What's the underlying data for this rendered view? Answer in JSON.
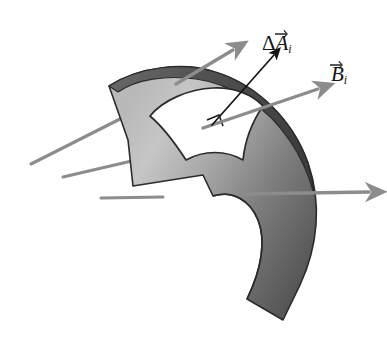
{
  "figure": {
    "name": "magnetic-flux-through-curved-surface",
    "background_color": "#ffffff",
    "width": 387,
    "height": 348
  },
  "labels": {
    "delta_area": {
      "delta": "Δ",
      "symbol": "A",
      "subscript": "i",
      "full_text": "ΔA⃗ᵢ",
      "color": "#141414"
    },
    "b_field": {
      "symbol": "B",
      "subscript": "i",
      "full_text": "B⃗ᵢ",
      "color": "#141414"
    }
  },
  "surface": {
    "name": "curved-shell-surface",
    "fill_light": "#c2c2c2",
    "fill_mid": "#9a9a9a",
    "fill_dark": "#585858",
    "edge_band_color": "#4a4a4a",
    "outline_color": "#2b2b2b"
  },
  "patch": {
    "name": "area-element-patch",
    "fill": "#ffffff",
    "outline_color": "#2b2b2b",
    "right_angle_marker": "right-angle-square"
  },
  "vectors": {
    "normal_vector": {
      "name": "delta-area-normal-vector",
      "color": "#141414",
      "style": "thin-black-arrow"
    },
    "field_lines": {
      "name": "magnetic-field-lines",
      "color": "#8c8c8c",
      "count": 6,
      "with_arrowhead": 3,
      "without_arrowhead": 3
    }
  }
}
